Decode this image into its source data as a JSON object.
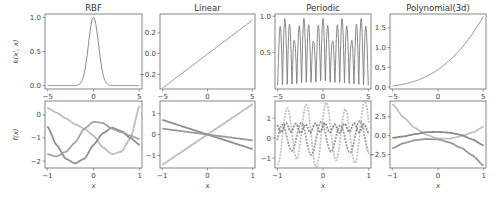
{
  "figure": {
    "background": "#ffffff",
    "axis_color": "#666666",
    "line_color": "#7a7a7a"
  },
  "chart_data": [
    {
      "type": "line",
      "title": "RBF",
      "row": "kernel",
      "xlabel": "",
      "ylabel": "k(x', x)",
      "xlim": [
        -5.3,
        5.3
      ],
      "ylim": [
        -0.05,
        1.05
      ],
      "xticks": [
        -5,
        0,
        5
      ],
      "yticks": [
        0.0,
        0.5,
        1.0
      ],
      "yticklabels": [
        "0.0",
        "0.5",
        "1.0"
      ],
      "function": "rbf",
      "series": [
        {
          "name": "k",
          "color": "#7a7a7a"
        }
      ]
    },
    {
      "type": "line",
      "title": "Linear",
      "row": "kernel",
      "xlabel": "",
      "ylabel": "",
      "xlim": [
        -5.3,
        5.3
      ],
      "ylim": [
        -0.34,
        0.38
      ],
      "xticks": [
        -5,
        0,
        5
      ],
      "yticks": [
        -0.2,
        0.0,
        0.2
      ],
      "yticklabels": [
        "-0.2",
        "0.0",
        "0.2"
      ],
      "function": "linear",
      "series": [
        {
          "name": "k",
          "color": "#7a7a7a"
        }
      ]
    },
    {
      "type": "line",
      "title": "Periodic",
      "row": "kernel",
      "xlabel": "",
      "ylabel": "",
      "xlim": [
        -5.3,
        5.3
      ],
      "ylim": [
        0.0,
        1.03
      ],
      "xticks": [
        -5,
        0,
        5
      ],
      "yticks": [
        0.5,
        1.0
      ],
      "yticklabels": [
        "0.5",
        "1.0"
      ],
      "function": "periodic",
      "series": [
        {
          "name": "k",
          "color": "#7a7a7a"
        }
      ]
    },
    {
      "type": "line",
      "title": "Polynomial(3d)",
      "row": "kernel",
      "xlabel": "",
      "ylabel": "",
      "xlim": [
        -5.3,
        5.3
      ],
      "ylim": [
        -0.05,
        1.85
      ],
      "xticks": [
        -5,
        0,
        5
      ],
      "yticks": [
        0.0,
        0.5,
        1.0,
        1.5
      ],
      "yticklabels": [
        "0.0",
        "0.5",
        "1.0",
        "1.5"
      ],
      "function": "poly",
      "series": [
        {
          "name": "k",
          "color": "#7a7a7a"
        }
      ]
    },
    {
      "type": "line",
      "title": "",
      "row": "samples",
      "xlabel": "x",
      "ylabel": "f(x)",
      "xlim": [
        -1.05,
        1.05
      ],
      "ylim": [
        -2.3,
        0.6
      ],
      "xticks": [
        -1,
        0,
        1
      ],
      "yticks": [
        -2,
        -1,
        0
      ],
      "yticklabels": [
        "-2",
        "-1",
        "0"
      ],
      "series": [
        {
          "name": "sample 1",
          "color": "#bdbdbd",
          "x": [
            -1,
            -0.8,
            -0.6,
            -0.4,
            -0.2,
            0,
            0.2,
            0.4,
            0.6,
            0.8,
            1
          ],
          "y": [
            0.3,
            0.1,
            -0.15,
            -0.4,
            -0.6,
            -0.9,
            -1.4,
            -1.7,
            -1.6,
            -1.0,
            0.4
          ]
        },
        {
          "name": "sample 2",
          "color": "#8f8f8f",
          "x": [
            -1,
            -0.8,
            -0.6,
            -0.4,
            -0.2,
            0,
            0.2,
            0.4,
            0.6,
            0.8,
            1
          ],
          "y": [
            -0.5,
            -1.3,
            -1.9,
            -2.1,
            -1.9,
            -1.3,
            -0.8,
            -0.55,
            -0.7,
            -1.0,
            -1.3
          ]
        },
        {
          "name": "sample 3",
          "color": "#a3a3a3",
          "x": [
            -1,
            -0.8,
            -0.6,
            -0.4,
            -0.2,
            0,
            0.2,
            0.4,
            0.6,
            0.8,
            1
          ],
          "y": [
            -1.7,
            -1.8,
            -1.6,
            -1.2,
            -0.6,
            -0.3,
            -0.35,
            -0.6,
            -0.75,
            -0.9,
            -1.05
          ]
        }
      ]
    },
    {
      "type": "line",
      "title": "",
      "row": "samples",
      "xlabel": "x",
      "ylabel": "",
      "xlim": [
        -1.05,
        1.05
      ],
      "ylim": [
        -1.6,
        1.6
      ],
      "xticks": [
        -1,
        0,
        1
      ],
      "yticks": [
        -1,
        0,
        1
      ],
      "yticklabels": [
        "-1",
        "0",
        "1"
      ],
      "series": [
        {
          "name": "sample 1",
          "color": "#bdbdbd",
          "x": [
            -1,
            1
          ],
          "y": [
            -1.45,
            1.45
          ]
        },
        {
          "name": "sample 2",
          "color": "#8f8f8f",
          "x": [
            -1,
            1
          ],
          "y": [
            0.7,
            -0.7
          ]
        },
        {
          "name": "sample 3",
          "color": "#9a9a9a",
          "x": [
            -1,
            1
          ],
          "y": [
            0.28,
            -0.28
          ]
        }
      ]
    },
    {
      "type": "line",
      "title": "",
      "row": "samples",
      "xlabel": "x",
      "ylabel": "",
      "xlim": [
        -1.05,
        1.05
      ],
      "ylim": [
        -1.5,
        1.85
      ],
      "xticks": [
        -1,
        0,
        1
      ],
      "yticks": [
        -1,
        0,
        1
      ],
      "yticklabels": [
        "-1",
        "0",
        "1"
      ],
      "series": [
        {
          "name": "sample 1",
          "color": "#c2c2c2",
          "amp": 1.45,
          "freq": 2.35,
          "phase": 0.6,
          "offset": 0.2
        },
        {
          "name": "sample 2",
          "color": "#9e9e9e",
          "amp": 0.75,
          "freq": 2.35,
          "phase": 2.2,
          "offset": 0.0
        },
        {
          "name": "sample 3",
          "color": "#8a8a8a",
          "amp": 0.22,
          "freq": 4.7,
          "phase": 0.3,
          "offset": 0.5
        }
      ]
    },
    {
      "type": "line",
      "title": "",
      "row": "samples",
      "xlabel": "x",
      "ylabel": "",
      "xlim": [
        -1.05,
        1.05
      ],
      "ylim": [
        -4.3,
        4.6
      ],
      "xticks": [
        -1,
        0,
        1
      ],
      "yticks": [
        -2.5,
        0.0,
        2.5
      ],
      "yticklabels": [
        "-2.5",
        "0.0",
        "2.5"
      ],
      "series": [
        {
          "name": "sample 1",
          "color": "#c2c2c2",
          "x": [
            -1,
            -0.75,
            -0.5,
            -0.25,
            0,
            0.25,
            0.5,
            0.75,
            1
          ],
          "y": [
            4.2,
            2.4,
            1.0,
            0.1,
            -0.4,
            -0.4,
            -0.1,
            0.4,
            1.2
          ]
        },
        {
          "name": "sample 2",
          "color": "#8a8a8a",
          "x": [
            -1,
            -0.75,
            -0.5,
            -0.25,
            0,
            0.25,
            0.5,
            0.75,
            1
          ],
          "y": [
            -0.3,
            -0.1,
            0.2,
            0.45,
            0.5,
            0.4,
            0.1,
            -0.5,
            -1.3
          ]
        },
        {
          "name": "sample 3",
          "color": "#999999",
          "x": [
            -1,
            -0.75,
            -0.5,
            -0.25,
            0,
            0.25,
            0.5,
            0.75,
            1
          ],
          "y": [
            -1.7,
            -1.0,
            -0.6,
            -0.45,
            -0.5,
            -0.9,
            -1.6,
            -2.6,
            -4.0
          ]
        }
      ]
    }
  ],
  "layout": {
    "cols_x": [
      [
        45,
        142
      ],
      [
        160,
        255
      ],
      [
        275,
        371
      ],
      [
        390,
        486
      ]
    ],
    "top_row_y": [
      14,
      89
    ],
    "bottom_row_y": [
      101,
      168
    ]
  }
}
